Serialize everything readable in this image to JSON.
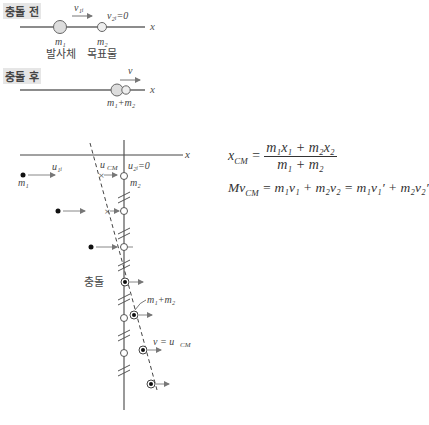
{
  "before": {
    "label": "충돌 전",
    "v1_label": "v₁ᵢ",
    "v2_label": "v₂ᵢ=0",
    "m1": "m₁",
    "m2": "m₂",
    "m1_role": "발사체",
    "m2_role": "목표물",
    "axis": "x"
  },
  "after": {
    "label": "충돌 후",
    "v_label": "v",
    "combined": "m₁+m₂",
    "axis": "x"
  },
  "frame": {
    "axis": "x",
    "u1_label": "u₁ᵢ",
    "ucm_label": "u",
    "ucm_sub": "CM",
    "u2_label": "u₂ᵢ=0",
    "m1": "m₁",
    "m2": "m₂",
    "collision_label": "충돌",
    "combined": "m₁+m₂",
    "final_label": "v = u",
    "final_sub": "CM"
  },
  "equations": {
    "xcm_lhs": "x",
    "xcm_sub": "CM",
    "xcm_num": "m₁x₁ + m₂x₂",
    "xcm_den": "m₁ + m₂",
    "momentum": "Mv",
    "momentum_sub": "CM",
    "momentum_rhs": " = m₁v₁ + m₂v₂ = m₁v₁′ + m₂v₂′"
  }
}
